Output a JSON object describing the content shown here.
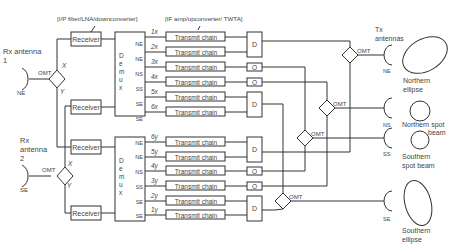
{
  "annotations": {
    "receiver_chain": "[I/P filter/LNA/downconverter]",
    "transmit_chain": "[IF amp/upconverter/ TWTA]",
    "tx_antennas": [
      "Tx",
      "antennas"
    ]
  },
  "rx_antennas": [
    {
      "label": [
        "Rx antenna",
        "1"
      ],
      "beam": "NE",
      "omt": "OMT",
      "x": "X",
      "y": "Y"
    },
    {
      "label": [
        "Rx",
        "antenna",
        "2"
      ],
      "beam": "SE",
      "omt": "OMT",
      "x": "X",
      "y": "Y"
    }
  ],
  "receiver_label": "Receiver",
  "demux_label": [
    "D",
    "e",
    "m",
    "u",
    "x"
  ],
  "demux1_ports": [
    "NE",
    "NE",
    "NS",
    "SS",
    "SE",
    "SE"
  ],
  "demux2_ports": [
    "NE",
    "NE",
    "NS",
    "SS",
    "SE",
    "SE"
  ],
  "channels_top": [
    "1x",
    "2x",
    "3x",
    "4x",
    "5x",
    "6x"
  ],
  "channels_bottom": [
    "6y",
    "5y",
    "4y",
    "3y",
    "2y",
    "1y"
  ],
  "transmit_label": "Transmit chain",
  "diplexer_label": "D",
  "circulator_label": "O",
  "omt_label": "OMT",
  "tx_antennas": [
    {
      "beam": "NE",
      "coverage": [
        "Northern",
        "ellipse"
      ]
    },
    {
      "beam": "NS",
      "coverage": [
        "Northern  spot",
        "beam"
      ]
    },
    {
      "beam": "SS",
      "coverage": [
        "Southern",
        "spot beam"
      ]
    },
    {
      "beam": "SE",
      "coverage": [
        "Southern",
        "ellipse"
      ]
    }
  ]
}
